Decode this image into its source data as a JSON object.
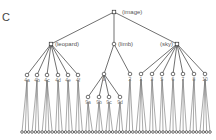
{
  "panel_label": "C",
  "tree": {
    "root": {
      "label": "(image)",
      "x": 114,
      "y": 12
    },
    "level1": [
      {
        "id": "leopard",
        "label": "(leopard)",
        "x": 51,
        "y": 44,
        "square": true
      },
      {
        "id": "limb",
        "label": "(limb)",
        "x": 114,
        "y": 44,
        "square": false
      },
      {
        "id": "sky",
        "label": "(sky)",
        "x": 177,
        "y": 44,
        "square": true
      }
    ],
    "level2": [
      {
        "parent": "leopard",
        "label": "4a",
        "x": 27,
        "y": 75
      },
      {
        "parent": "leopard",
        "label": "4b",
        "x": 37,
        "y": 75
      },
      {
        "parent": "leopard",
        "label": "4c",
        "x": 47,
        "y": 75
      },
      {
        "parent": "leopard",
        "label": "4d",
        "x": 58,
        "y": 75
      },
      {
        "parent": "leopard",
        "label": "4e",
        "x": 68,
        "y": 75
      },
      {
        "parent": "leopard",
        "label": "4f",
        "x": 78,
        "y": 75
      },
      {
        "parent": "limb",
        "label": "9",
        "x": 104,
        "y": 74,
        "id": "n9"
      },
      {
        "parent": "limb",
        "label": "2",
        "x": 130,
        "y": 74
      },
      {
        "parent": "sky",
        "label": "1",
        "x": 141,
        "y": 74
      },
      {
        "parent": "sky",
        "label": "3",
        "x": 152,
        "y": 74
      },
      {
        "parent": "sky",
        "label": "5",
        "x": 162,
        "y": 74
      },
      {
        "parent": "sky",
        "label": "6",
        "x": 173,
        "y": 74
      },
      {
        "parent": "sky",
        "label": "7",
        "x": 183,
        "y": 74
      },
      {
        "parent": "sky",
        "label": "8",
        "x": 194,
        "y": 74
      },
      {
        "parent": "sky",
        "label": "10",
        "x": 205,
        "y": 74
      }
    ],
    "level3": [
      {
        "parent": "n9",
        "label": "9a",
        "x": 88,
        "y": 97
      },
      {
        "parent": "n9",
        "label": "9b",
        "x": 99,
        "y": 97
      },
      {
        "parent": "n9",
        "label": "9c",
        "x": 109,
        "y": 97
      },
      {
        "parent": "n9",
        "label": "9d",
        "x": 120,
        "y": 97
      }
    ],
    "leaf_row_y": 132,
    "leaf_row_x_start": 22,
    "leaf_row_x_end": 210,
    "leaf_count": 57
  }
}
